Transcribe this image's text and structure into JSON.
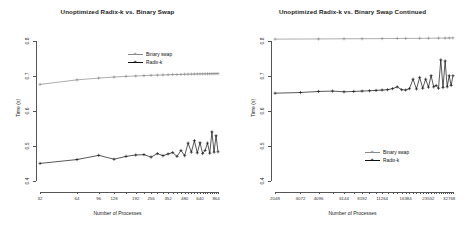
{
  "figure": {
    "axis_title_x": "Number of Processes",
    "axis_title_y": "Time (s)"
  },
  "chart_data": [
    {
      "type": "line",
      "panel": "left",
      "title": "Unoptimized Radix-k vs. Binary Swap",
      "xlabel": "Number of Processes",
      "ylabel": "Time (s)",
      "ylim": [
        0.38,
        0.83
      ],
      "yticks": [
        0.4,
        0.5,
        0.6,
        0.7,
        0.8
      ],
      "ytick_labels": [
        "0.4",
        "0.5",
        "0.6",
        "0.7",
        "0.8"
      ],
      "xlim": [
        32,
        896
      ],
      "xticks": [
        32,
        64,
        96,
        128,
        192,
        256,
        352,
        480,
        640,
        864
      ],
      "xtick_labels": [
        "32",
        "64",
        "96",
        "128",
        "192",
        "256",
        "352",
        "480",
        "640",
        "864"
      ],
      "xscale": "log2-like",
      "grid": false,
      "legend_position": "top-right",
      "series": [
        {
          "name": "Binary swap",
          "color": "#8a8a8a",
          "marker": "plus",
          "x": [
            32,
            64,
            96,
            128,
            160,
            192,
            224,
            256,
            288,
            320,
            352,
            384,
            416,
            448,
            480,
            512,
            544,
            576,
            608,
            640,
            672,
            704,
            736,
            768,
            800,
            832,
            864,
            896
          ],
          "y": [
            0.675,
            0.688,
            0.693,
            0.696,
            0.698,
            0.699,
            0.7,
            0.701,
            0.7015,
            0.702,
            0.7025,
            0.703,
            0.7032,
            0.7035,
            0.704,
            0.7042,
            0.7044,
            0.7046,
            0.7048,
            0.705,
            0.7051,
            0.7052,
            0.7053,
            0.7054,
            0.7055,
            0.7056,
            0.7057,
            0.7058
          ]
        },
        {
          "name": "Radix-k",
          "color": "#111111",
          "marker": "plus",
          "x": [
            32,
            64,
            96,
            128,
            160,
            192,
            224,
            256,
            288,
            320,
            352,
            384,
            416,
            448,
            480,
            512,
            544,
            576,
            608,
            640,
            672,
            704,
            736,
            768,
            800,
            832,
            864,
            896
          ],
          "y": [
            0.45,
            0.461,
            0.473,
            0.462,
            0.47,
            0.474,
            0.475,
            0.468,
            0.478,
            0.472,
            0.477,
            0.481,
            0.47,
            0.487,
            0.472,
            0.508,
            0.482,
            0.515,
            0.48,
            0.509,
            0.478,
            0.487,
            0.508,
            0.479,
            0.54,
            0.482,
            0.529,
            0.483
          ]
        }
      ]
    },
    {
      "type": "line",
      "panel": "right",
      "title": "Unoptimized Radix-k vs. Binary Swap Continued",
      "xlabel": "Number of Processes",
      "ylabel": "Time (s)",
      "ylim": [
        0.38,
        0.83
      ],
      "yticks": [
        0.4,
        0.5,
        0.6,
        0.7,
        0.8
      ],
      "ytick_labels": [
        "0.4",
        "0.5",
        "0.6",
        "0.7",
        "0.8"
      ],
      "xlim": [
        2048,
        34816
      ],
      "xticks": [
        2048,
        3072,
        4096,
        6144,
        8192,
        11264,
        16384,
        23552,
        32768
      ],
      "xtick_labels": [
        "2048",
        "3072",
        "4096",
        "6144",
        "8192",
        "11264",
        "16384",
        "23552",
        "32768"
      ],
      "xscale": "log2-like",
      "grid": false,
      "legend_position": "bottom-right",
      "series": [
        {
          "name": "Binary swap",
          "color": "#8a8a8a",
          "marker": "plus",
          "x": [
            2048,
            4096,
            6144,
            8192,
            11264,
            14336,
            16384,
            20480,
            23552,
            27648,
            30720,
            32768,
            34816
          ],
          "y": [
            0.804,
            0.8045,
            0.805,
            0.8052,
            0.8055,
            0.8058,
            0.806,
            0.8062,
            0.8065,
            0.8068,
            0.807,
            0.8072,
            0.8075
          ]
        },
        {
          "name": "Radix-k",
          "color": "#111111",
          "marker": "plus",
          "x": [
            2048,
            3072,
            4096,
            5120,
            6144,
            7168,
            8192,
            9216,
            10240,
            11264,
            12288,
            13312,
            14336,
            15360,
            16384,
            17408,
            18432,
            19456,
            20480,
            21504,
            22528,
            23552,
            24576,
            25600,
            26624,
            27648,
            28672,
            29696,
            30720,
            31744,
            32768,
            33792,
            34816
          ],
          "y": [
            0.65,
            0.652,
            0.655,
            0.656,
            0.654,
            0.655,
            0.656,
            0.657,
            0.658,
            0.659,
            0.66,
            0.663,
            0.668,
            0.66,
            0.659,
            0.663,
            0.69,
            0.662,
            0.695,
            0.664,
            0.69,
            0.667,
            0.7,
            0.668,
            0.672,
            0.664,
            0.745,
            0.666,
            0.742,
            0.668,
            0.7,
            0.672,
            0.7
          ]
        }
      ]
    }
  ]
}
